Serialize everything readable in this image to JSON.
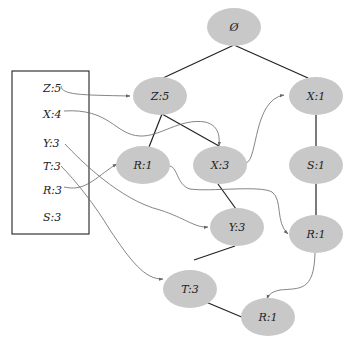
{
  "header_table": {
    "items": [
      {
        "label": "Z:5",
        "y": 88
      },
      {
        "label": "X:4",
        "y": 114
      },
      {
        "label": "Y:3",
        "y": 143
      },
      {
        "label": "T:3",
        "y": 166
      },
      {
        "label": "R:3",
        "y": 190
      },
      {
        "label": "S:3",
        "y": 217
      }
    ]
  },
  "tree": {
    "nodes": [
      {
        "id": "root",
        "label": "Ø",
        "cx": 234,
        "cy": 27
      },
      {
        "id": "z5",
        "label": "Z:5",
        "cx": 160,
        "cy": 96
      },
      {
        "id": "x1",
        "label": "X:1",
        "cx": 316,
        "cy": 96
      },
      {
        "id": "r1a",
        "label": "R:1",
        "cx": 143,
        "cy": 165
      },
      {
        "id": "x3",
        "label": "X:3",
        "cx": 220,
        "cy": 165
      },
      {
        "id": "s1",
        "label": "S:1",
        "cx": 316,
        "cy": 165
      },
      {
        "id": "y3",
        "label": "Y:3",
        "cx": 237,
        "cy": 227
      },
      {
        "id": "r1b",
        "label": "R:1",
        "cx": 316,
        "cy": 234
      },
      {
        "id": "t3",
        "label": "T:3",
        "cx": 190,
        "cy": 289
      },
      {
        "id": "r1c",
        "label": "R:1",
        "cx": 268,
        "cy": 317
      }
    ]
  },
  "colors": {
    "node_fill": "#c8c8c8",
    "tree_edge": "#222222",
    "link_edge": "#666666"
  }
}
